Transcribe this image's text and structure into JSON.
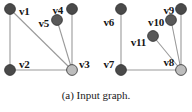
{
  "figure": {
    "caption": "(a) Input graph.",
    "background": "#ffffff",
    "edge_color": "#9a9a9a",
    "node_stroke": "#2d2d2d",
    "label_color": "#141414"
  },
  "graphs": [
    {
      "name": "left-graph",
      "nodes": [
        {
          "id": "v1",
          "label": "v1",
          "cx": 10,
          "cy": 9,
          "r": 5.4,
          "fill": "#4a4a4a",
          "label_x": 19,
          "label_y": 11,
          "label_anchor": "start"
        },
        {
          "id": "v2",
          "label": "v2",
          "cx": 10,
          "cy": 70,
          "r": 5.4,
          "fill": "#4a4a4a",
          "label_x": 19,
          "label_y": 64,
          "label_anchor": "start"
        },
        {
          "id": "v3",
          "label": "v3",
          "cx": 72,
          "cy": 70,
          "r": 5.4,
          "fill": "#bdbdbd",
          "label_x": 79,
          "label_y": 64,
          "label_anchor": "start"
        },
        {
          "id": "v4",
          "label": "v4",
          "cx": 72,
          "cy": 9,
          "r": 5.4,
          "fill": "#4a4a4a",
          "label_x": 63,
          "label_y": 10,
          "label_anchor": "end"
        },
        {
          "id": "v5",
          "label": "v5",
          "cx": 57,
          "cy": 20,
          "r": 5.4,
          "fill": "#595959",
          "label_x": 49,
          "label_y": 23,
          "label_anchor": "end"
        }
      ],
      "edges": [
        {
          "from": "v1",
          "to": "v2"
        },
        {
          "from": "v1",
          "to": "v3"
        },
        {
          "from": "v2",
          "to": "v3"
        },
        {
          "from": "v4",
          "to": "v3"
        },
        {
          "from": "v5",
          "to": "v3"
        }
      ]
    },
    {
      "name": "right-graph",
      "nodes": [
        {
          "id": "v6",
          "label": "v6",
          "cx": 121,
          "cy": 9,
          "r": 5.4,
          "fill": "#4a4a4a",
          "label_x": 114,
          "label_y": 22,
          "label_anchor": "end"
        },
        {
          "id": "v7",
          "label": "v7",
          "cx": 121,
          "cy": 70,
          "r": 5.4,
          "fill": "#4a4a4a",
          "label_x": 114,
          "label_y": 64,
          "label_anchor": "end"
        },
        {
          "id": "v8",
          "label": "v8",
          "cx": 181,
          "cy": 70,
          "r": 5.4,
          "fill": "#bdbdbd",
          "label_x": 174,
          "label_y": 62,
          "label_anchor": "end"
        },
        {
          "id": "v9",
          "label": "v9",
          "cx": 181,
          "cy": 9,
          "r": 5.4,
          "fill": "#4a4a4a",
          "label_x": 174,
          "label_y": 10,
          "label_anchor": "end"
        },
        {
          "id": "v10",
          "label": "v10",
          "cx": 171,
          "cy": 20,
          "r": 5.4,
          "fill": "#595959",
          "label_x": 164,
          "label_y": 22,
          "label_anchor": "end"
        },
        {
          "id": "v11",
          "label": "v11",
          "cx": 153,
          "cy": 36,
          "r": 5.4,
          "fill": "#595959",
          "label_x": 146,
          "label_y": 42,
          "label_anchor": "end"
        }
      ],
      "edges": [
        {
          "from": "v6",
          "to": "v7"
        },
        {
          "from": "v7",
          "to": "v8"
        },
        {
          "from": "v9",
          "to": "v8"
        },
        {
          "from": "v10",
          "to": "v8"
        },
        {
          "from": "v11",
          "to": "v8"
        }
      ]
    }
  ]
}
